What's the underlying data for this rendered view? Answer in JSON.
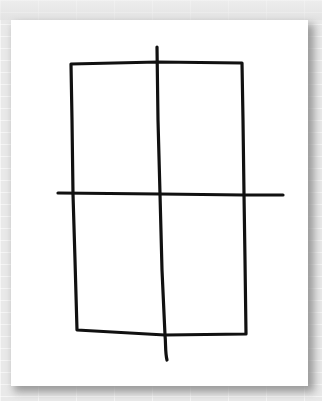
{
  "canvas": {
    "width": 322,
    "height": 401,
    "background_color": "#e9e9e9",
    "paper_color": "#ffffff",
    "shadow_color": "#8a8a8a"
  },
  "sketch": {
    "description": "Hand-drawn rectangle divided into four panes by a vertical and a horizontal line that both extend beyond the frame",
    "stroke_color": "#111111",
    "stroke_width": 3.2,
    "paths": {
      "frame": "M71,64 L158,62 L242,63 L243,120 L244,194 L245,260 L246,334 L165,335 L77,330 L75,260 L73,194 L72,120 Z",
      "vertical_line": "M157,47 L158,120 L160,194 L162,270 L165,335 C166,345 165,352 167,360",
      "horizontal_line": "M58,193 L160,194 L244,195 L283,195"
    }
  }
}
